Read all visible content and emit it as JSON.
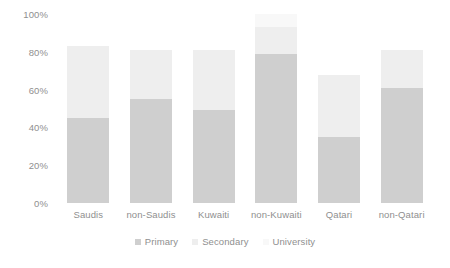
{
  "chart_data": {
    "type": "bar",
    "subtype": "stacked-bar",
    "title": "",
    "xlabel": "",
    "ylabel": "",
    "ylim": [
      0,
      100
    ],
    "yticks": [
      0,
      20,
      40,
      60,
      80,
      100
    ],
    "ytick_labels": [
      "0%",
      "20%",
      "40%",
      "60%",
      "80%",
      "100%"
    ],
    "grid": false,
    "legend_position": "bottom-center",
    "categories": [
      "Saudis",
      "non-Saudis",
      "Kuwaiti",
      "non-Kuwaiti",
      "Qatari",
      "non-Qatari"
    ],
    "series": [
      {
        "name": "Primary",
        "color": "#cfcfcf",
        "values": [
          45,
          55,
          49,
          79,
          35,
          61
        ]
      },
      {
        "name": "Secondary",
        "color": "#eeeeee",
        "values": [
          38,
          26,
          32,
          14,
          33,
          20
        ]
      },
      {
        "name": "University",
        "color": "#f8f8f8",
        "values": [
          0,
          0,
          0,
          7,
          0,
          0
        ]
      }
    ],
    "totals": [
      83,
      81,
      81,
      100,
      68,
      81
    ]
  },
  "legend": {
    "items": [
      {
        "label": "Primary",
        "swatch": "primary"
      },
      {
        "label": "Secondary",
        "swatch": "secondary"
      },
      {
        "label": "University",
        "swatch": "university"
      }
    ]
  }
}
